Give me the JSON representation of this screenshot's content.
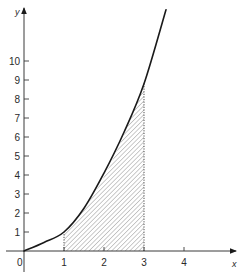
{
  "chart_data": {
    "type": "area",
    "title": "",
    "xlabel": "x",
    "ylabel": "y",
    "xlim": [
      0,
      4.3
    ],
    "ylim": [
      0,
      12.9
    ],
    "grid": false,
    "legend": null,
    "x_ticks": [
      {
        "value": 0,
        "label": "0"
      },
      {
        "value": 1,
        "label": "1"
      },
      {
        "value": 2,
        "label": "2"
      },
      {
        "value": 3,
        "label": "3"
      },
      {
        "value": 4,
        "label": "4"
      }
    ],
    "y_ticks": [
      {
        "value": 1,
        "label": "1"
      },
      {
        "value": 2,
        "label": "2"
      },
      {
        "value": 3,
        "label": "3"
      },
      {
        "value": 4,
        "label": "4"
      },
      {
        "value": 5,
        "label": "5"
      },
      {
        "value": 6,
        "label": "6"
      },
      {
        "value": 7,
        "label": "7"
      },
      {
        "value": 8,
        "label": "8"
      },
      {
        "value": 9,
        "label": "9"
      },
      {
        "value": 10,
        "label": "10"
      }
    ],
    "series": [
      {
        "name": "curve",
        "description": "increasing convex curve approximately y = x^2",
        "x": [
          0,
          0.5,
          1,
          1.5,
          2,
          2.5,
          3,
          3.55
        ],
        "y": [
          0,
          0.45,
          1,
          2.25,
          4.1,
          6.25,
          8.8,
          12.7
        ]
      }
    ],
    "shaded_region": {
      "from_x": 1,
      "to_x": 3,
      "under": "curve",
      "fill": "diagonal hatching",
      "boundary_style": "dotted vertical lines at x = 1 and x = 3"
    }
  },
  "figure": {
    "origin_label": "0",
    "x_axis_label": "x",
    "y_axis_label": "y",
    "colors": {
      "axis": "#3a3a3a",
      "curve": "#1a1a1a",
      "hatch": "#8a8a8a",
      "text": "#2a2a2a",
      "background": "#ffffff"
    }
  }
}
